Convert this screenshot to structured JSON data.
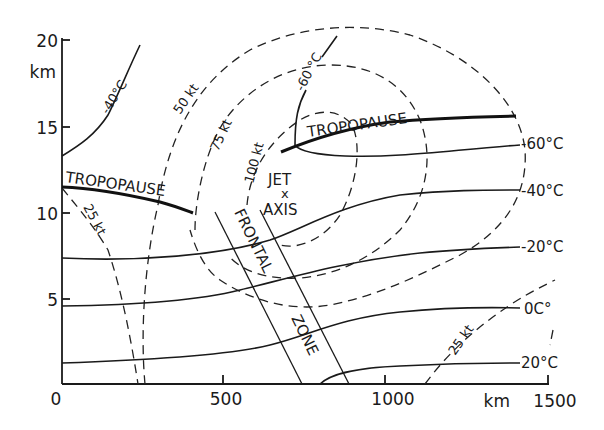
{
  "figure": {
    "type": "vertical cross-section of jet stream and frontal zone",
    "y_axis": {
      "unit_label": "km",
      "ticks": [
        "0",
        "5",
        "10",
        "15",
        "20"
      ]
    },
    "x_axis": {
      "unit_label": "km",
      "ticks": [
        "0",
        "500",
        "1000",
        "1500"
      ]
    },
    "labels": {
      "tropopause_left": "TROPOPAUSE",
      "tropopause_right": "TROPOPAUSE",
      "jet": "JET",
      "jet_marker": "x",
      "axis": "AXIS",
      "frontal": "FRONTAL",
      "zone": "ZONE"
    },
    "isotherms": [
      {
        "label": "-40°C",
        "position": "upper-left"
      },
      {
        "label": "-60 °C",
        "position": "upper-center"
      },
      {
        "label": "-60°C",
        "position": "right"
      },
      {
        "label": "-40°C",
        "position": "right"
      },
      {
        "label": "-20°C",
        "position": "right"
      },
      {
        "label": "0C°",
        "position": "right"
      },
      {
        "label": "20°C",
        "position": "right"
      }
    ],
    "isotachs": [
      {
        "label": "25 kt",
        "position": "left"
      },
      {
        "label": "50 kt"
      },
      {
        "label": "75 kt"
      },
      {
        "label": "100 kt"
      },
      {
        "label": "25 kt",
        "position": "right"
      }
    ]
  }
}
